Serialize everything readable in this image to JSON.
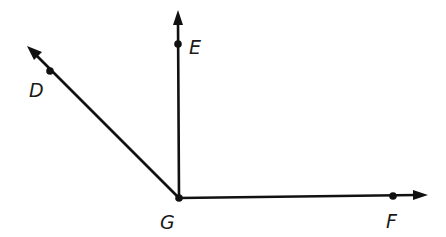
{
  "diagram": {
    "type": "geometry-angles",
    "colors": {
      "stroke": "#111111",
      "label": "#1a1a1a",
      "background": "#ffffff"
    },
    "vertex": {
      "name": "G",
      "label": "G",
      "x": 179,
      "y": 198
    },
    "points": [
      {
        "name": "D",
        "label": "D",
        "x": 50,
        "y": 71
      },
      {
        "name": "E",
        "label": "E",
        "x": 178,
        "y": 44
      },
      {
        "name": "F",
        "label": "F",
        "x": 393,
        "y": 196
      }
    ],
    "rays": [
      {
        "name": "ray-GD",
        "from": "G",
        "through": "D",
        "end": [
          27,
          46
        ]
      },
      {
        "name": "ray-GE",
        "from": "G",
        "through": "E",
        "end": [
          178,
          10
        ]
      },
      {
        "name": "ray-GF",
        "from": "G",
        "through": "F",
        "end": [
          427,
          195
        ]
      }
    ],
    "labels": {
      "D": "D",
      "E": "E",
      "F": "F",
      "G": "G"
    }
  }
}
